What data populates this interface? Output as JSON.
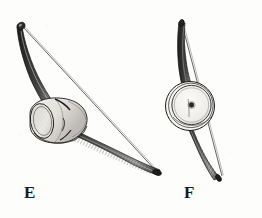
{
  "plate": {
    "type": "engraving-illustration",
    "subject": "musical bow with gourd resonator, two views",
    "background_color": "#fdfdfc",
    "ink_color": "#1c1c1c",
    "line_color": "#3a3a3a",
    "figures": [
      {
        "id": "E",
        "label": "E",
        "label_x": 24,
        "label_y": 184,
        "view": "oblique three-quarter view",
        "description": "Curved bow stave running from upper left to lower right with a single straight string stretched between the two tips and an open cylindrical gourd resonator lashed to the stave below its midpoint.",
        "parts": [
          "upper-limb",
          "lower-limb",
          "string",
          "gourd-resonator",
          "lashing"
        ]
      },
      {
        "id": "F",
        "label": "F",
        "label_x": 184,
        "label_y": 184,
        "view": "frontal view",
        "description": "Same bow seen face on; the stave is nearly vertical and slightly S curved, the string passes in front of a round resonator drawn as concentric rings with a small central sound hole.",
        "parts": [
          "upper-limb",
          "lower-limb",
          "string",
          "round-resonator",
          "concentric-rings",
          "center-hole"
        ]
      }
    ]
  }
}
